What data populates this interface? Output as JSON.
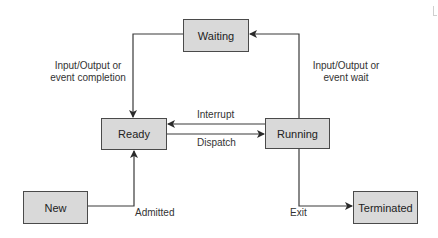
{
  "diagram": {
    "states": {
      "waiting": "Waiting",
      "ready": "Ready",
      "running": "Running",
      "new": "New",
      "terminated": "Terminated"
    },
    "transitions": {
      "io_completion_line1": "Input/Output or",
      "io_completion_line2": "event completion",
      "io_wait_line1": "Input/Output or",
      "io_wait_line2": "event wait",
      "interrupt": "Interrupt",
      "dispatch": "Dispatch",
      "admitted": "Admitted",
      "exit": "Exit"
    },
    "colors": {
      "box_fill": "#d9d9d9",
      "box_border": "#4a4a4a",
      "line": "#3a3a3a",
      "text": "#2a2a2a"
    }
  }
}
